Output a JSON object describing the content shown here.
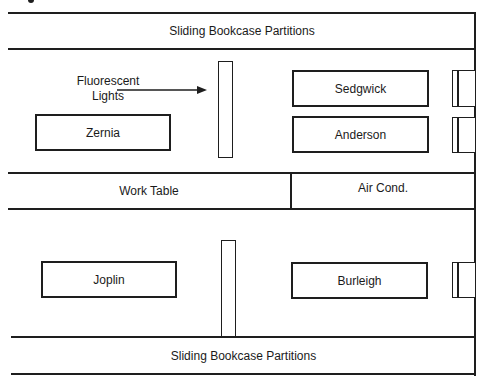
{
  "diagram": {
    "type": "office floor plan",
    "partitions": {
      "top_label": "Sliding Bookcase Partitions",
      "bottom_label": "Sliding Bookcase Partitions"
    },
    "annotation": {
      "line1": "Fluorescent",
      "line2": "Lights"
    },
    "middle_row": {
      "left_label": "Work Table",
      "right_label": "Air Cond."
    },
    "desks": [
      {
        "name": "Zernia"
      },
      {
        "name": "Sedgwick"
      },
      {
        "name": "Anderson"
      },
      {
        "name": "Joplin"
      },
      {
        "name": "Burleigh"
      }
    ],
    "colors": {
      "line": "#1e1e1e",
      "background": "#ffffff"
    }
  }
}
